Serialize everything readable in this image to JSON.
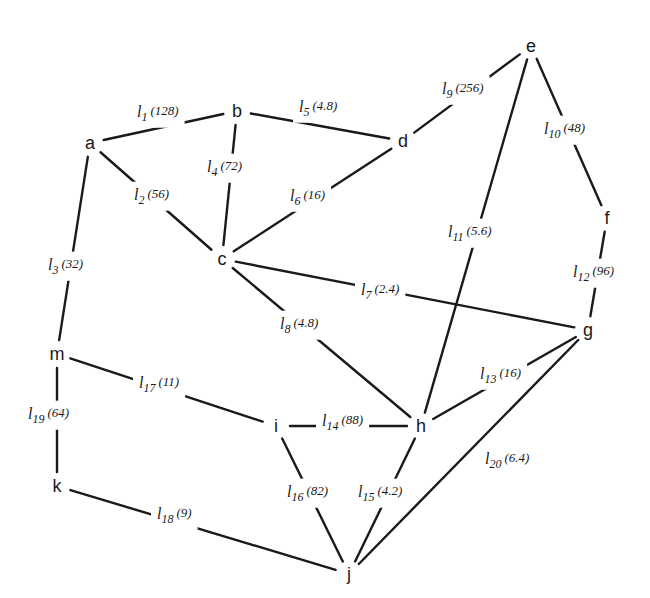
{
  "diagram": {
    "type": "weighted-graph",
    "nodes": [
      {
        "id": "a",
        "label": "a",
        "x": 90,
        "y": 143
      },
      {
        "id": "b",
        "label": "b",
        "x": 237,
        "y": 111
      },
      {
        "id": "c",
        "label": "c",
        "x": 222,
        "y": 259
      },
      {
        "id": "d",
        "label": "d",
        "x": 403,
        "y": 141
      },
      {
        "id": "e",
        "label": "e",
        "x": 531,
        "y": 46
      },
      {
        "id": "f",
        "label": "f",
        "x": 607,
        "y": 218
      },
      {
        "id": "g",
        "label": "g",
        "x": 588,
        "y": 330
      },
      {
        "id": "h",
        "label": "h",
        "x": 421,
        "y": 426
      },
      {
        "id": "i",
        "label": "i",
        "x": 276,
        "y": 426
      },
      {
        "id": "j",
        "label": "j",
        "x": 349,
        "y": 574
      },
      {
        "id": "k",
        "label": "k",
        "x": 57,
        "y": 486
      },
      {
        "id": "m",
        "label": "m",
        "x": 57,
        "y": 354
      }
    ],
    "edges": [
      {
        "id": "l1",
        "from": "a",
        "to": "b",
        "name": "l",
        "index": "1",
        "weight": "(128)",
        "lx": 137,
        "ly": 113
      },
      {
        "id": "l2",
        "from": "a",
        "to": "c",
        "name": "l",
        "index": "2",
        "weight": "(56)",
        "lx": 134,
        "ly": 196
      },
      {
        "id": "l3",
        "from": "a",
        "to": "m",
        "name": "l",
        "index": "3",
        "weight": "(32)",
        "lx": 48,
        "ly": 266
      },
      {
        "id": "l4",
        "from": "b",
        "to": "c",
        "name": "l",
        "index": "4",
        "weight": "(72)",
        "lx": 207,
        "ly": 168
      },
      {
        "id": "l5",
        "from": "b",
        "to": "d",
        "name": "l",
        "index": "5",
        "weight": "(4.8)",
        "lx": 299,
        "ly": 108
      },
      {
        "id": "l6",
        "from": "c",
        "to": "d",
        "name": "l",
        "index": "6",
        "weight": "(16)",
        "lx": 290,
        "ly": 197
      },
      {
        "id": "l7",
        "from": "c",
        "to": "g",
        "name": "l",
        "index": "7",
        "weight": "(2.4)",
        "lx": 361,
        "ly": 291
      },
      {
        "id": "l8",
        "from": "c",
        "to": "h",
        "name": "l",
        "index": "8",
        "weight": "(4.8)",
        "lx": 280,
        "ly": 325
      },
      {
        "id": "l9",
        "from": "d",
        "to": "e",
        "name": "l",
        "index": "9",
        "weight": "(256)",
        "lx": 442,
        "ly": 90
      },
      {
        "id": "l10",
        "from": "e",
        "to": "f",
        "name": "l",
        "index": "10",
        "weight": "(48)",
        "lx": 544,
        "ly": 130
      },
      {
        "id": "l11",
        "from": "e",
        "to": "h",
        "name": "l",
        "index": "11",
        "weight": "(5.6)",
        "lx": 448,
        "ly": 233
      },
      {
        "id": "l12",
        "from": "f",
        "to": "g",
        "name": "l",
        "index": "12",
        "weight": "(96)",
        "lx": 573,
        "ly": 273
      },
      {
        "id": "l13",
        "from": "g",
        "to": "h",
        "name": "l",
        "index": "13",
        "weight": "(16)",
        "lx": 480,
        "ly": 375
      },
      {
        "id": "l14",
        "from": "i",
        "to": "h",
        "name": "l",
        "index": "14",
        "weight": "(88)",
        "lx": 322,
        "ly": 422
      },
      {
        "id": "l15",
        "from": "h",
        "to": "j",
        "name": "l",
        "index": "15",
        "weight": "(4.2)",
        "lx": 358,
        "ly": 493
      },
      {
        "id": "l16",
        "from": "i",
        "to": "j",
        "name": "l",
        "index": "16",
        "weight": "(82)",
        "lx": 287,
        "ly": 493
      },
      {
        "id": "l17",
        "from": "m",
        "to": "i",
        "name": "l",
        "index": "17",
        "weight": "(11)",
        "lx": 139,
        "ly": 384
      },
      {
        "id": "l18",
        "from": "k",
        "to": "j",
        "name": "l",
        "index": "18",
        "weight": "(9)",
        "lx": 157,
        "ly": 515
      },
      {
        "id": "l19",
        "from": "m",
        "to": "k",
        "name": "l",
        "index": "19",
        "weight": "(64)",
        "lx": 28,
        "ly": 415
      },
      {
        "id": "l20",
        "from": "g",
        "to": "j",
        "name": "l",
        "index": "20",
        "weight": "(6.4)",
        "lx": 485,
        "ly": 460
      }
    ]
  }
}
